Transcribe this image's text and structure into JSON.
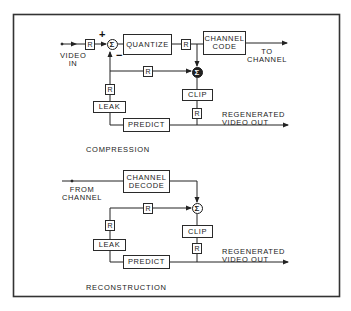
{
  "diagram": {
    "type": "block-diagram",
    "compression": {
      "title": "COMPRESSION",
      "input_label_line1": "VIDEO",
      "input_label_line2": "IN",
      "blocks": {
        "quantize": "QUANTIZE",
        "channel_code_line1": "CHANNEL",
        "channel_code_line2": "CODE",
        "clip": "CLIP",
        "leak": "LEAK",
        "predict": "PREDICT",
        "r": "R"
      },
      "summer_symbol": "Σ",
      "plus_sign": "+",
      "minus_sign": "−",
      "output_channel_line1": "TO",
      "output_channel_line2": "CHANNEL",
      "output_video_line1": "REGENERATED",
      "output_video_line2": "VIDEO OUT"
    },
    "reconstruction": {
      "title": "RECONSTRUCTION",
      "input_label_line1": "FROM",
      "input_label_line2": "CHANNEL",
      "blocks": {
        "channel_decode_line1": "CHANNEL",
        "channel_decode_line2": "DECODE",
        "clip": "CLIP",
        "leak": "LEAK",
        "predict": "PREDICT",
        "r": "R"
      },
      "summer_symbol": "Σ",
      "output_video_line1": "REGENERATED",
      "output_video_line2": "VIDEO OUT"
    },
    "colors": {
      "line": "#222222",
      "background": "#ffffff"
    }
  }
}
